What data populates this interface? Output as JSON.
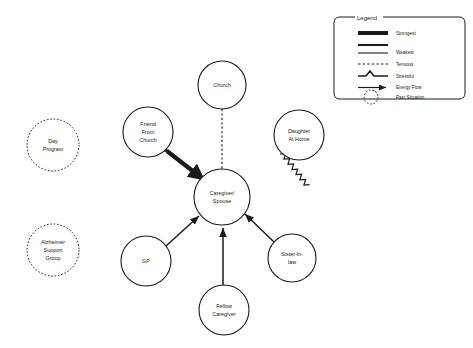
{
  "diagram": {
    "type": "ecomap",
    "center": {
      "label_lines": [
        "Caregiver/",
        "Spouse"
      ],
      "cx": 222,
      "cy": 197,
      "r": 28
    },
    "nodes": [
      {
        "id": "church",
        "label_lines": [
          "Church"
        ],
        "cx": 222,
        "cy": 85,
        "r": 24,
        "style": "solid"
      },
      {
        "id": "friend-church",
        "label_lines": [
          "Friend",
          "From",
          "Church"
        ],
        "cx": 148,
        "cy": 132,
        "r": 25,
        "style": "solid"
      },
      {
        "id": "daughter-home",
        "label_lines": [
          "Daughter",
          "At Home"
        ],
        "cx": 299,
        "cy": 135,
        "r": 25,
        "style": "solid"
      },
      {
        "id": "sister-in-law",
        "label_lines": [
          "Sister-in-",
          "law"
        ],
        "cx": 292,
        "cy": 258,
        "r": 24,
        "style": "solid"
      },
      {
        "id": "fellow-caregiver",
        "label_lines": [
          "Fellow",
          "Caregiver"
        ],
        "cx": 224,
        "cy": 310,
        "r": 25,
        "style": "solid"
      },
      {
        "id": "gp",
        "label_lines": [
          "GP"
        ],
        "cx": 146,
        "cy": 261,
        "r": 25,
        "style": "solid"
      },
      {
        "id": "day-program",
        "label_lines": [
          "Day",
          "Program"
        ],
        "cx": 53,
        "cy": 145,
        "r": 26,
        "style": "dashed"
      },
      {
        "id": "support-group",
        "label_lines": [
          "Alzheimer",
          "Support",
          "Group"
        ],
        "cx": 53,
        "cy": 250,
        "r": 26,
        "style": "dashed"
      }
    ],
    "links": [
      {
        "from": "church",
        "to": "center",
        "style": "tenuous",
        "arrows": "none"
      },
      {
        "from": "friend-church",
        "to": "center",
        "style": "strongest",
        "arrows": "both"
      },
      {
        "from": "daughter-home",
        "to": "center",
        "style": "stressful",
        "arrows": "none"
      },
      {
        "from": "sister-in-law",
        "to": "center",
        "style": "weakest",
        "arrows": "to-center"
      },
      {
        "from": "fellow-caregiver",
        "to": "center",
        "style": "weakest",
        "arrows": "to-center"
      },
      {
        "from": "gp",
        "to": "center",
        "style": "weakest",
        "arrows": "to-center"
      }
    ]
  },
  "legend": {
    "title": "Legend",
    "items": [
      {
        "label": "Strongest",
        "sample": "thick-line"
      },
      {
        "label": "Weakest",
        "sample": "medium-line"
      },
      {
        "label": "Tenuous",
        "sample": "dashed-line"
      },
      {
        "label": "Stressful",
        "sample": "zigzag-line"
      },
      {
        "label": "Energy Flow",
        "sample": "arrow-line"
      },
      {
        "label": "Past Situation",
        "sample": "dashed-circle"
      }
    ]
  },
  "colors": {
    "stroke": "#1a1a1a",
    "background": "#ffffff"
  }
}
